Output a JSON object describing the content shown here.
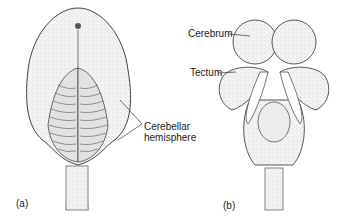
{
  "figure": {
    "panels": [
      {
        "id": "a",
        "label": "(a)",
        "annotations": [
          {
            "text_line1": "Cerebellar",
            "text_line2": "hemisphere"
          }
        ]
      },
      {
        "id": "b",
        "label": "(b)",
        "annotations": [
          {
            "text": "Cerebrum"
          },
          {
            "text": "Tectum"
          }
        ]
      }
    ]
  }
}
